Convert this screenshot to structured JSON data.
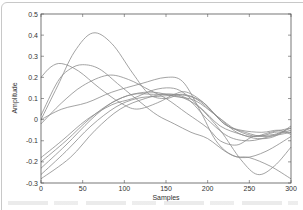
{
  "chart_data": {
    "type": "line",
    "title": "",
    "xlabel": "Samples",
    "ylabel": "Amplitude",
    "xlim": [
      0,
      300
    ],
    "ylim": [
      -0.3,
      0.5
    ],
    "xticks": [
      "0",
      "50",
      "100",
      "150",
      "200",
      "250",
      "300"
    ],
    "yticks": [
      "0.5",
      "0.4",
      "0.3",
      "0.2",
      "0.1",
      "0",
      "-0.1",
      "-0.2",
      "-0.3"
    ],
    "grid": false,
    "legend": null,
    "line_color": "#8c8c8c",
    "series": [
      {
        "name": "trace-1",
        "points": [
          [
            0,
            0.0
          ],
          [
            20,
            0.16
          ],
          [
            40,
            0.32
          ],
          [
            62,
            0.41
          ],
          [
            85,
            0.36
          ],
          [
            110,
            0.22
          ],
          [
            130,
            0.12
          ],
          [
            150,
            0.1
          ],
          [
            170,
            0.12
          ],
          [
            195,
            0.08
          ],
          [
            220,
            -0.02
          ],
          [
            245,
            -0.06
          ],
          [
            270,
            -0.08
          ],
          [
            300,
            -0.05
          ]
        ]
      },
      {
        "name": "trace-2",
        "points": [
          [
            0,
            0.2
          ],
          [
            12,
            0.25
          ],
          [
            25,
            0.265
          ],
          [
            45,
            0.23
          ],
          [
            70,
            0.15
          ],
          [
            95,
            0.08
          ],
          [
            115,
            0.05
          ],
          [
            140,
            0.08
          ],
          [
            160,
            0.12
          ],
          [
            175,
            0.13
          ],
          [
            195,
            0.08
          ],
          [
            220,
            -0.02
          ],
          [
            240,
            -0.05
          ],
          [
            265,
            -0.06
          ],
          [
            285,
            -0.05
          ],
          [
            300,
            -0.07
          ]
        ]
      },
      {
        "name": "trace-3",
        "points": [
          [
            0,
            0.02
          ],
          [
            20,
            0.18
          ],
          [
            35,
            0.24
          ],
          [
            50,
            0.26
          ],
          [
            70,
            0.24
          ],
          [
            95,
            0.16
          ],
          [
            120,
            0.08
          ],
          [
            140,
            0.02
          ],
          [
            160,
            -0.02
          ],
          [
            180,
            -0.06
          ],
          [
            200,
            -0.09
          ],
          [
            225,
            -0.16
          ],
          [
            245,
            -0.18
          ],
          [
            270,
            -0.15
          ],
          [
            300,
            -0.08
          ]
        ]
      },
      {
        "name": "trace-4",
        "points": [
          [
            0,
            -0.02
          ],
          [
            25,
            0.08
          ],
          [
            50,
            0.16
          ],
          [
            80,
            0.21
          ],
          [
            105,
            0.19
          ],
          [
            130,
            0.14
          ],
          [
            150,
            0.1
          ],
          [
            175,
            0.03
          ],
          [
            200,
            -0.04
          ],
          [
            215,
            -0.1
          ],
          [
            235,
            -0.12
          ],
          [
            255,
            -0.08
          ],
          [
            280,
            -0.07
          ],
          [
            300,
            -0.04
          ]
        ]
      },
      {
        "name": "trace-5",
        "points": [
          [
            0,
            0.0
          ],
          [
            25,
            0.05
          ],
          [
            55,
            0.08
          ],
          [
            85,
            0.13
          ],
          [
            120,
            0.17
          ],
          [
            150,
            0.2
          ],
          [
            170,
            0.18
          ],
          [
            190,
            0.05
          ],
          [
            210,
            -0.1
          ],
          [
            230,
            -0.17
          ],
          [
            250,
            -0.18
          ],
          [
            275,
            -0.22
          ],
          [
            300,
            -0.28
          ]
        ]
      },
      {
        "name": "trace-6",
        "points": [
          [
            0,
            -0.18
          ],
          [
            25,
            -0.1
          ],
          [
            55,
            0.0
          ],
          [
            85,
            0.07
          ],
          [
            110,
            0.1
          ],
          [
            135,
            0.14
          ],
          [
            155,
            0.15
          ],
          [
            170,
            0.13
          ],
          [
            190,
            0.06
          ],
          [
            215,
            -0.05
          ],
          [
            240,
            -0.19
          ],
          [
            260,
            -0.26
          ],
          [
            280,
            -0.22
          ],
          [
            300,
            -0.13
          ]
        ]
      },
      {
        "name": "trace-7",
        "points": [
          [
            0,
            -0.2
          ],
          [
            30,
            -0.1
          ],
          [
            60,
            0.01
          ],
          [
            85,
            0.08
          ],
          [
            110,
            0.12
          ],
          [
            135,
            0.12
          ],
          [
            160,
            0.12
          ],
          [
            185,
            0.1
          ],
          [
            210,
            0.02
          ],
          [
            235,
            -0.06
          ],
          [
            255,
            -0.08
          ],
          [
            275,
            -0.06
          ],
          [
            300,
            -0.04
          ]
        ]
      },
      {
        "name": "trace-8",
        "points": [
          [
            0,
            -0.23
          ],
          [
            30,
            -0.12
          ],
          [
            60,
            0.0
          ],
          [
            85,
            0.08
          ],
          [
            110,
            0.12
          ],
          [
            135,
            0.13
          ],
          [
            160,
            0.11
          ],
          [
            185,
            0.09
          ],
          [
            210,
            0.02
          ],
          [
            235,
            -0.05
          ],
          [
            260,
            -0.08
          ],
          [
            280,
            -0.06
          ],
          [
            300,
            -0.06
          ]
        ]
      },
      {
        "name": "trace-9",
        "points": [
          [
            0,
            -0.26
          ],
          [
            30,
            -0.15
          ],
          [
            60,
            -0.03
          ],
          [
            90,
            0.06
          ],
          [
            115,
            0.1
          ],
          [
            140,
            0.11
          ],
          [
            165,
            0.11
          ],
          [
            190,
            0.06
          ],
          [
            215,
            -0.03
          ],
          [
            240,
            -0.07
          ],
          [
            260,
            -0.09
          ],
          [
            280,
            -0.08
          ],
          [
            300,
            -0.03
          ]
        ]
      },
      {
        "name": "trace-10",
        "points": [
          [
            0,
            -0.28
          ],
          [
            35,
            -0.18
          ],
          [
            65,
            -0.05
          ],
          [
            95,
            0.05
          ],
          [
            125,
            0.1
          ],
          [
            150,
            0.12
          ],
          [
            175,
            0.1
          ],
          [
            200,
            0.0
          ],
          [
            225,
            -0.08
          ],
          [
            250,
            -0.1
          ],
          [
            275,
            -0.08
          ],
          [
            300,
            -0.06
          ]
        ]
      }
    ]
  }
}
